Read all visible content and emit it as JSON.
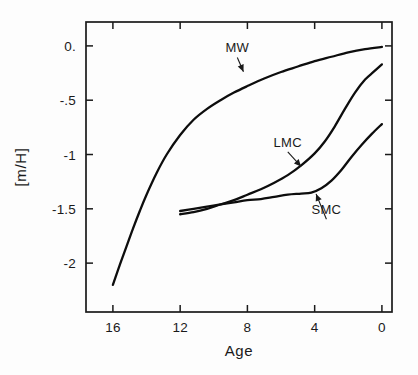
{
  "chart_data": {
    "type": "line",
    "title": "",
    "xlabel": "Age",
    "ylabel": "[m/H]",
    "xlim": [
      17.6,
      -0.6
    ],
    "ylim": [
      -2.45,
      0.22
    ],
    "x_ticks": [
      16,
      12,
      8,
      4,
      0
    ],
    "x_tick_labels": [
      "16",
      "12",
      "8",
      "4",
      "0"
    ],
    "y_ticks": [
      0,
      -0.5,
      -1,
      -1.5,
      -2
    ],
    "y_tick_labels": [
      "0.",
      "-.5",
      "-1",
      "-1.5",
      "-2"
    ],
    "x_axis_inverted": true,
    "grid": false,
    "legend": "inline-annotations",
    "series": [
      {
        "name": "MW",
        "label": "MW",
        "color": "#0d0d0d",
        "x": [
          16.0,
          15.6,
          15.2,
          14.8,
          14.4,
          14.0,
          13.4,
          12.8,
          12.0,
          11.2,
          10.4,
          9.6,
          8.8,
          8.0,
          7.0,
          6.0,
          5.0,
          4.0,
          3.0,
          2.0,
          1.0,
          0.0
        ],
        "y": [
          -2.2,
          -2.02,
          -1.85,
          -1.68,
          -1.52,
          -1.37,
          -1.17,
          -1.0,
          -0.82,
          -0.68,
          -0.58,
          -0.5,
          -0.43,
          -0.37,
          -0.3,
          -0.24,
          -0.19,
          -0.14,
          -0.1,
          -0.06,
          -0.03,
          -0.01
        ]
      },
      {
        "name": "LMC",
        "label": "LMC",
        "color": "#0d0d0d",
        "x": [
          12.0,
          11.2,
          10.4,
          9.6,
          8.8,
          8.0,
          7.2,
          6.4,
          5.6,
          4.8,
          4.0,
          3.4,
          2.8,
          2.2,
          1.6,
          1.0,
          0.5,
          0.0
        ],
        "y": [
          -1.55,
          -1.53,
          -1.5,
          -1.46,
          -1.42,
          -1.37,
          -1.32,
          -1.26,
          -1.19,
          -1.1,
          -0.99,
          -0.88,
          -0.74,
          -0.58,
          -0.43,
          -0.31,
          -0.24,
          -0.17
        ]
      },
      {
        "name": "SMC",
        "label": "SMC",
        "color": "#0d0d0d",
        "x": [
          12.0,
          11.2,
          10.4,
          9.6,
          8.8,
          8.0,
          7.2,
          6.4,
          5.6,
          4.8,
          4.2,
          3.6,
          3.0,
          2.4,
          1.8,
          1.2,
          0.6,
          0.0
        ],
        "y": [
          -1.52,
          -1.5,
          -1.48,
          -1.46,
          -1.44,
          -1.42,
          -1.41,
          -1.39,
          -1.37,
          -1.36,
          -1.35,
          -1.31,
          -1.24,
          -1.14,
          -1.02,
          -0.91,
          -0.81,
          -0.72
        ]
      }
    ],
    "annotations": [
      {
        "text": "MW",
        "x": 8.6,
        "y": -0.06,
        "point_x": 8.2,
        "point_y": -0.25
      },
      {
        "text": "LMC",
        "x": 5.6,
        "y": -0.93,
        "point_x": 4.75,
        "point_y": -1.12
      },
      {
        "text": "SMC",
        "x": 3.3,
        "y": -1.55,
        "point_x": 3.95,
        "point_y": -1.35
      }
    ]
  }
}
